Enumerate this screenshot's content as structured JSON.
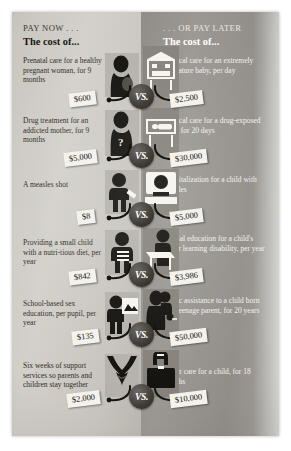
{
  "poster": {
    "header_left": "PAY NOW . . .",
    "header_right": ". . . OR PAY LATER",
    "subhead_left": "The cost of...",
    "subhead_right": "The cost of...",
    "vs_label": "VS."
  },
  "rows": [
    {
      "left_text": "Prenatal care for a healthy pregnant woman, for 9 months",
      "left_price": "$600",
      "left_icon": "pregnant-woman-icon",
      "right_text": "Medical care for an extremely premature baby, per day",
      "right_price": "$2,500",
      "right_icon": "incubator-icon"
    },
    {
      "left_text": "Drug treatment for an addicted mother, for 9 months",
      "left_price": "$5,000",
      "left_icon": "addicted-mother-icon",
      "right_text": "Medical care for a drug-exposed baby, for 20 days",
      "right_price": "$30,000",
      "right_icon": "hospital-crib-icon"
    },
    {
      "left_text": "A measles shot",
      "left_price": "$8",
      "left_icon": "child-vaccination-icon",
      "right_text": "Hospitalization for a child with measles",
      "right_price": "$5,000",
      "right_icon": "hospital-bed-child-icon"
    },
    {
      "left_text": "Providing a small child with a nutri-tious diet, per year",
      "left_price": "$842",
      "left_icon": "child-with-food-icon",
      "right_text": "Special education for a child's minor learning disability, per year",
      "right_price": "$3,986",
      "right_icon": "child-at-desk-icon"
    },
    {
      "left_text": "School-based sex education, per pupil, per year",
      "left_price": "$135",
      "left_icon": "classroom-screen-icon",
      "right_text": "Public assistance to a child born of a teenage parent, for 20 years",
      "right_price": "$50,000",
      "right_icon": "teen-parent-family-icon"
    },
    {
      "left_text": "Six weeks of support services so parents and children stay together",
      "left_price": "$2,000",
      "left_icon": "clasped-hands-icon",
      "right_text": "Foster care for a child, for 18 months",
      "right_price": "$10,000",
      "right_icon": "suitcase-icon"
    }
  ],
  "colors": {
    "panel_left": "#c9c6c0",
    "panel_right": "#908d88",
    "ink": "#17150f",
    "tag_bg": "#f4f2ed"
  }
}
